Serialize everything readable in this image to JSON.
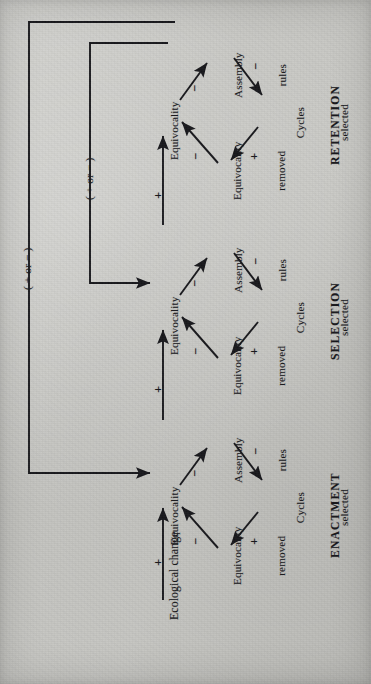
{
  "figure": {
    "orientation": "rotated-90-ccw",
    "background_color": "#c6c6c3",
    "ink_color": "#16161a"
  },
  "input": {
    "label": "Ecological change",
    "arrow_sign": "+"
  },
  "loops": [
    {
      "name": "outer-feedback-loop",
      "label": "( + or − )",
      "from": "retention-equivocality",
      "to": "enactment-equivocality"
    },
    {
      "name": "inner-feedback-loop",
      "label": "( + or − )",
      "from": "retention-equivocality",
      "to": "selection-equivocality"
    }
  ],
  "links": [
    {
      "name": "enactment-to-selection",
      "sign": "+"
    },
    {
      "name": "selection-to-retention",
      "sign": "+"
    }
  ],
  "stages": [
    {
      "id": "enactment",
      "title": "ENACTMENT",
      "equivocality": "Equivocality",
      "assembly_rules": {
        "line1": "Assembly",
        "line2": "rules"
      },
      "cycles_selected": {
        "line1": "Cycles",
        "line2": "selected"
      },
      "equivocality_removed": {
        "line1": "Equivocality",
        "line2": "removed"
      },
      "signs": {
        "equivocality_to_assembly_rules": "−",
        "assembly_rules_to_cycles": "−",
        "cycles_to_removed": "+",
        "removed_to_equivocality": "−"
      }
    },
    {
      "id": "selection",
      "title": "SELECTION",
      "equivocality": "Equivocality",
      "assembly_rules": {
        "line1": "Assembly",
        "line2": "rules"
      },
      "cycles_selected": {
        "line1": "Cycles",
        "line2": "selected"
      },
      "equivocality_removed": {
        "line1": "Equivocality",
        "line2": "removed"
      },
      "signs": {
        "equivocality_to_assembly_rules": "−",
        "assembly_rules_to_cycles": "−",
        "cycles_to_removed": "+",
        "removed_to_equivocality": "−"
      }
    },
    {
      "id": "retention",
      "title": "RETENTION",
      "equivocality": "Equivocality",
      "assembly_rules": {
        "line1": "Assembly",
        "line2": "rules"
      },
      "cycles_selected": {
        "line1": "Cycles",
        "line2": "selected"
      },
      "equivocality_removed": {
        "line1": "Equivocality",
        "line2": "removed"
      },
      "signs": {
        "equivocality_to_assembly_rules": "−",
        "assembly_rules_to_cycles": "−",
        "cycles_to_removed": "+",
        "removed_to_equivocality": "−"
      }
    }
  ]
}
